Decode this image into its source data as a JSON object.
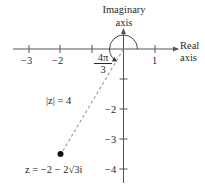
{
  "figure": {
    "axes": {
      "imaginary_label_line1": "Imaginary",
      "imaginary_label_line2": "axis",
      "real_label_line1": "Real",
      "real_label_line2": "axis"
    },
    "real_ticks": [
      {
        "value": -3,
        "label": "−3"
      },
      {
        "value": -2,
        "label": "−2"
      },
      {
        "value": -1,
        "label": ""
      },
      {
        "value": 1,
        "label": "1"
      }
    ],
    "imag_ticks": [
      {
        "value": -1,
        "label": ""
      },
      {
        "value": -2,
        "label": "−2"
      },
      {
        "value": -3,
        "label": "−3"
      },
      {
        "value": -4,
        "label": "−4"
      }
    ],
    "angle_label": {
      "numerator": "4π",
      "denominator": "3"
    },
    "modulus_label": "|z| = 4",
    "point_label": "z = −2 − 2√3i",
    "point": {
      "re": -2,
      "im": -3.464
    },
    "colors": {
      "ink": "#2a2a2a",
      "dash": "#9a9a9a",
      "axis": "#555555"
    }
  }
}
